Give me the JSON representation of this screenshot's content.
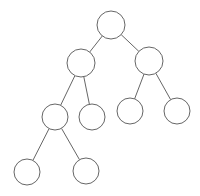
{
  "diagram": {
    "type": "binary-tree",
    "stroke_color": "#666666",
    "background": "#ffffff",
    "nodes": [
      {
        "id": "n0",
        "cx": 111,
        "cy": 25,
        "r": 14
      },
      {
        "id": "n1",
        "cx": 81,
        "cy": 63,
        "r": 14
      },
      {
        "id": "n2",
        "cx": 149,
        "cy": 61,
        "r": 14
      },
      {
        "id": "n3",
        "cx": 55,
        "cy": 117,
        "r": 13
      },
      {
        "id": "n4",
        "cx": 92,
        "cy": 117,
        "r": 13
      },
      {
        "id": "n5",
        "cx": 130,
        "cy": 111,
        "r": 13
      },
      {
        "id": "n6",
        "cx": 177,
        "cy": 111,
        "r": 13
      },
      {
        "id": "n7",
        "cx": 27,
        "cy": 172,
        "r": 13
      },
      {
        "id": "n8",
        "cx": 86,
        "cy": 171,
        "r": 13
      }
    ],
    "edges": [
      [
        "n0",
        "n1"
      ],
      [
        "n0",
        "n2"
      ],
      [
        "n1",
        "n3"
      ],
      [
        "n1",
        "n4"
      ],
      [
        "n2",
        "n5"
      ],
      [
        "n2",
        "n6"
      ],
      [
        "n3",
        "n7"
      ],
      [
        "n3",
        "n8"
      ]
    ]
  }
}
